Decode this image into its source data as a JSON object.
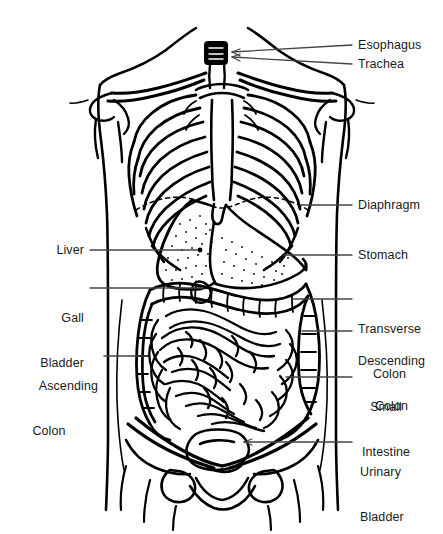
{
  "figure": {
    "style": "black-and-white line drawing",
    "background_color": "#ffffff",
    "line_color": "#000000",
    "text_color": "#1a1a1a"
  },
  "labels": {
    "esophagus": "Esophagus",
    "trachea": "Trachea",
    "diaphragm": "Diaphragm",
    "stomach": "Stomach",
    "liver": "Liver",
    "gall_bladder_line1": "Gall",
    "gall_bladder_line2": "Bladder",
    "transverse_colon_line1": "Transverse",
    "transverse_colon_line2": "Colon",
    "descending_colon_line1": "Descending",
    "descending_colon_line2": "Colon",
    "ascending_colon_line1": "Ascending",
    "ascending_colon_line2": "Colon",
    "small_intestine_line1": "Small",
    "small_intestine_line2": "Intestine",
    "urinary_bladder_line1": "Urinary",
    "urinary_bladder_line2": "Bladder"
  },
  "structures": [
    "torso-outline",
    "clavicle-left",
    "clavicle-right",
    "shoulder-left",
    "shoulder-right",
    "rib-cage",
    "sternum",
    "trachea",
    "diaphragm-dashed-line",
    "liver",
    "stomach",
    "gall-bladder",
    "transverse-colon",
    "ascending-colon",
    "descending-colon",
    "small-intestine",
    "pelvis",
    "urinary-bladder"
  ]
}
